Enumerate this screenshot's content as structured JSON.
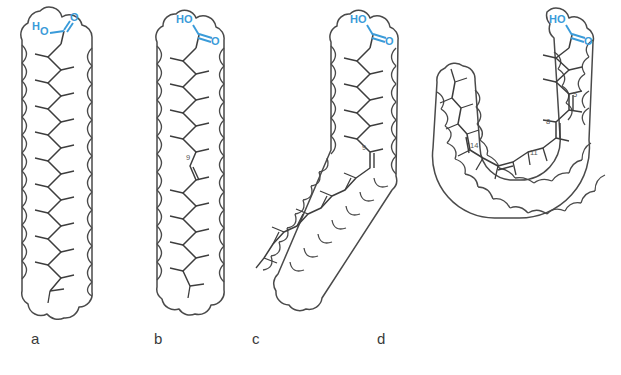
{
  "figure": {
    "background_color": "#ffffff",
    "outline_color": "#4a4a4a",
    "bond_color": "#3d3d3d",
    "carboxyl_color": "#3a9bd9",
    "label_color": "#3a3a3a",
    "locant_color": "#555555"
  },
  "panels": [
    {
      "id": "a",
      "caption": "a",
      "caption_x": 31,
      "caption_y": 330,
      "description": "saturated straight chain fatty acid",
      "carboxyl": {
        "hydroxyl": "H",
        "hydroxyl_o": "O",
        "carbonyl_o": "O"
      },
      "double_bonds": [],
      "locants": []
    },
    {
      "id": "b",
      "caption": "b",
      "caption_x": 154,
      "caption_y": 330,
      "description": "trans monounsaturated fatty acid, straight chain",
      "carboxyl": {
        "hydroxyl": "HO",
        "carbonyl_o": "O"
      },
      "double_bonds": [
        9
      ],
      "locants": [
        "9"
      ]
    },
    {
      "id": "c",
      "caption": "c",
      "caption_x": 252,
      "caption_y": 330,
      "description": "cis monounsaturated fatty acid, bent chain",
      "carboxyl": {
        "hydroxyl": "HO",
        "carbonyl_o": "O"
      },
      "double_bonds": [
        9
      ],
      "locants": [
        "9"
      ]
    },
    {
      "id": "d",
      "caption": "d",
      "caption_x": 377,
      "caption_y": 330,
      "description": "polyunsaturated fatty acid, U-shaped chain",
      "carboxyl": {
        "hydroxyl": "HO",
        "carbonyl_o": "O"
      },
      "double_bonds": [
        5,
        8,
        11,
        14
      ],
      "locants": [
        "5",
        "8",
        "11",
        "14"
      ]
    }
  ]
}
